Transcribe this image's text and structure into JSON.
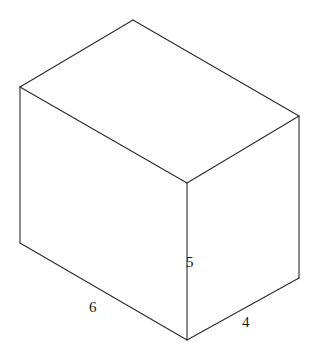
{
  "figure": {
    "shape_name": "rectangular-prism",
    "stroke_color": "#2b2b2b",
    "face_color": "#ffffff",
    "background_color": "#ffffff",
    "labels": {
      "height": "5",
      "length": "6",
      "width": "4"
    },
    "geometry": {
      "units": "pixels",
      "canvas": {
        "width": 316,
        "height": 362
      },
      "vertices": {
        "top_back": [
          133,
          20
        ],
        "top_left": [
          20,
          87
        ],
        "top_right": [
          299,
          116
        ],
        "top_front": [
          187,
          183
        ],
        "bottom_left": [
          20,
          243
        ],
        "bottom_front": [
          187,
          340
        ],
        "bottom_right": [
          299,
          278
        ]
      },
      "edges": [
        [
          "top_back",
          "top_left"
        ],
        [
          "top_back",
          "top_right"
        ],
        [
          "top_left",
          "top_front"
        ],
        [
          "top_right",
          "top_front"
        ],
        [
          "top_left",
          "bottom_left"
        ],
        [
          "top_right",
          "bottom_right"
        ],
        [
          "top_front",
          "bottom_front"
        ],
        [
          "bottom_left",
          "bottom_front"
        ],
        [
          "bottom_front",
          "bottom_right"
        ]
      ]
    }
  },
  "chart_data": {
    "type": "diagram",
    "categories": [
      "length",
      "height",
      "width"
    ],
    "values": [
      6,
      5,
      4
    ],
    "annotations": [
      {
        "name": "length",
        "text": "6",
        "edge": "bottom-left-front",
        "position": [
          89,
          300
        ]
      },
      {
        "name": "height",
        "text": "5",
        "edge": "front-vertical",
        "position": [
          186,
          255
        ]
      },
      {
        "name": "width",
        "text": "4",
        "edge": "bottom-front-right",
        "position": [
          242,
          315
        ]
      }
    ]
  }
}
